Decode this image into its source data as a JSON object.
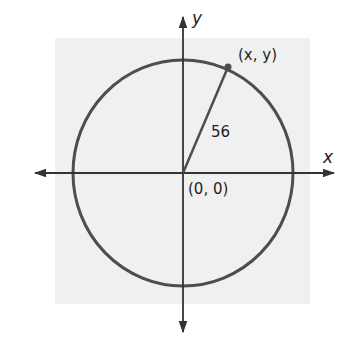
{
  "diagram": {
    "axes": {
      "x_label": "x",
      "y_label": "y"
    },
    "circle": {
      "center_label": "(0, 0)",
      "radius_label": "56",
      "point_label": "(x, y)"
    },
    "colors": {
      "background_panel": "#f0f0f0",
      "circle": "#4d4d4d",
      "axes": "#333333",
      "text": "#1e1e1e"
    }
  }
}
